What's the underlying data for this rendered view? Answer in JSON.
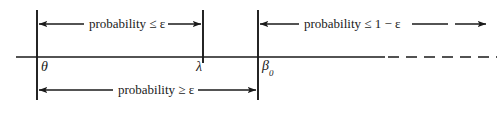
{
  "figure": {
    "type": "number-line-diagram",
    "background_color": "#ffffff",
    "ink_color": "#1a1a1a",
    "axis": {
      "x_start": 16,
      "x_solid_end": 385,
      "x_dashed_end": 497,
      "y": 57,
      "dashed": true
    },
    "ticks": [
      {
        "id": "theta",
        "label": "θ",
        "subscript": "",
        "x": 37,
        "y_top": 10,
        "y_bottom": 100
      },
      {
        "id": "lambda",
        "label": "λ",
        "subscript": "",
        "x": 203,
        "y_top": 10,
        "y_bottom": 63
      },
      {
        "id": "beta",
        "label": "β",
        "subscript": "0",
        "x": 258,
        "y_top": 10,
        "y_bottom": 100
      }
    ],
    "annotations": [
      {
        "id": "upper-left-bracket",
        "text": "probability ≤ ε",
        "from_tick": "theta",
        "to_tick": "lambda",
        "y": 24,
        "arrow_left": true,
        "arrow_right": true,
        "dashed_tail": false
      },
      {
        "id": "upper-right-bracket",
        "text": "probability ≤ 1 − ε",
        "from_tick": "beta",
        "to_tick": "open-right",
        "y": 24,
        "arrow_left": true,
        "arrow_right": true,
        "dashed_tail": true
      },
      {
        "id": "lower-bracket",
        "text": "probability ≥ ε",
        "from_tick": "theta",
        "to_tick": "beta",
        "y": 90,
        "arrow_left": true,
        "arrow_right": true,
        "dashed_tail": false
      }
    ]
  }
}
